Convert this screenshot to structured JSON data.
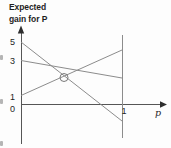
{
  "figure": {
    "title_lines": [
      "Expected",
      "gain for P"
    ],
    "y_tick_labels": [
      "5",
      "3",
      "1",
      "0"
    ],
    "x_tick_label": "1",
    "x_axis_label": "p"
  },
  "chart_data": {
    "type": "line",
    "title": "Expected gain for P",
    "xlabel": "p",
    "ylabel": "Expected gain for P",
    "x_range": [
      0,
      1
    ],
    "x_ticks": [
      0,
      1
    ],
    "y_ticks": [
      0,
      1,
      3,
      5
    ],
    "grid": false,
    "legend": false,
    "series": [
      {
        "x": [
          0,
          1
        ],
        "values": [
          5,
          -1
        ]
      },
      {
        "x": [
          0,
          1
        ],
        "values": [
          3,
          2
        ]
      },
      {
        "x": [
          0,
          1
        ],
        "values": [
          1,
          4
        ]
      }
    ],
    "annotations": [
      {
        "type": "circle-marker",
        "x": 0.44,
        "y": 2.33,
        "description": "circled intersection of the line from 5 and the line from 1"
      },
      {
        "type": "vertical-reference-line",
        "x": 1
      }
    ]
  },
  "layout_px": {
    "y_axis": {
      "x": 21,
      "top": 29,
      "bottom": 144,
      "arrow_points": "21,25.5 17.8,33.5 24.2,33.5"
    },
    "x_axis": {
      "y": 104.5,
      "left": 21,
      "right": 161.5,
      "arrow_points": "167,104.5 160,101.3 160,107.7"
    },
    "ref_line": {
      "x": 122,
      "top": 35,
      "bottom": 138
    },
    "series_lines": [
      {
        "x1": 21,
        "y1": 42,
        "x2": 122,
        "y2": 121
      },
      {
        "x1": 21,
        "y1": 60.5,
        "x2": 122,
        "y2": 78
      },
      {
        "x1": 21,
        "y1": 95.5,
        "x2": 122,
        "y2": 50
      }
    ],
    "circle_marker": {
      "cx": 64,
      "cy": 77.5,
      "r": 4
    }
  },
  "colors": {
    "background": "#fdfdfd",
    "axis": "#565656",
    "arrow": "#2e2e2e",
    "line": "#8c8c8c",
    "marker": "#7a7a7a",
    "text": "#1f1f1f",
    "artifact": "#b5b5b5"
  }
}
